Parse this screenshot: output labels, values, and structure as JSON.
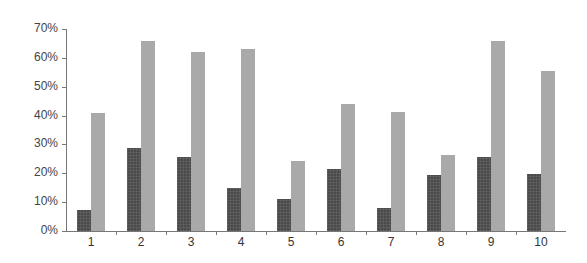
{
  "chart_data": {
    "type": "bar",
    "title": "",
    "xlabel": "",
    "ylabel": "",
    "categories": [
      "1",
      "2",
      "3",
      "4",
      "5",
      "6",
      "7",
      "8",
      "9",
      "10"
    ],
    "series": [
      {
        "name": "Series 1",
        "color": "#4a4a4a",
        "values": [
          7.4,
          28.6,
          25.6,
          14.8,
          11.0,
          21.5,
          7.8,
          19.4,
          25.6,
          19.7
        ]
      },
      {
        "name": "Series 2",
        "color": "#a9a9a9",
        "values": [
          40.8,
          66.0,
          62.2,
          63.0,
          24.2,
          44.1,
          41.3,
          26.5,
          65.7,
          55.6
        ]
      }
    ],
    "ylim": [
      0,
      70
    ],
    "yticks": [
      "0%",
      "10%",
      "20%",
      "30%",
      "40%",
      "50%",
      "60%",
      "70%"
    ],
    "grid": false,
    "legend": "none"
  }
}
